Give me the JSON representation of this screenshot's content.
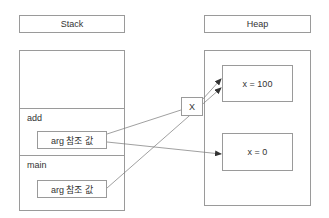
{
  "stack": {
    "header": "Stack",
    "frames": [
      {
        "name": "add",
        "arg_label": "arg 참조 값"
      },
      {
        "name": "main",
        "arg_label": "arg 참조 값"
      }
    ]
  },
  "heap": {
    "header": "Heap",
    "objects": [
      {
        "label": "x = 100"
      },
      {
        "label": "x = 0"
      }
    ]
  },
  "broken_link": {
    "label": "X"
  },
  "colors": {
    "border": "#9a9a9a",
    "arrow": "#555555",
    "text": "#333333"
  }
}
